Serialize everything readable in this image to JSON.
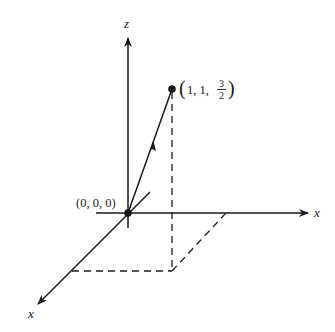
{
  "diagram": {
    "type": "3d-coordinate-vector",
    "axes": {
      "vertical": {
        "label": "z"
      },
      "horizontal": {
        "label": "x"
      },
      "diagonal": {
        "label": "x"
      }
    },
    "origin": {
      "label": "(0, 0, 0)"
    },
    "point": {
      "label_prefix": "1, 1, ",
      "frac_num": "3",
      "frac_den": "2",
      "coords": [
        1,
        1,
        1.5
      ]
    },
    "colors": {
      "ink": "#1a1a1a",
      "background": "#ffffff"
    }
  }
}
